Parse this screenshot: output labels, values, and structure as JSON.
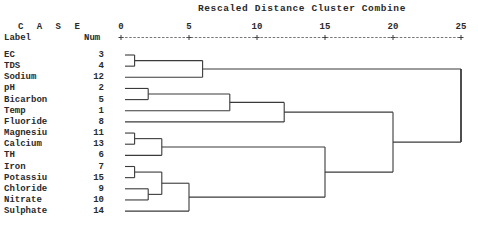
{
  "chart_data": {
    "type": "dendrogram",
    "title": "Rescaled Distance Cluster Combine",
    "column_headers": {
      "case": "C A S E",
      "label": "Label",
      "num": "Num"
    },
    "axis": {
      "ticks": [
        0,
        5,
        10,
        15,
        20,
        25
      ],
      "range": [
        0,
        25
      ]
    },
    "leaves": [
      {
        "label": "EC",
        "num": 3
      },
      {
        "label": "TDS",
        "num": 4
      },
      {
        "label": "Sodium",
        "num": 12
      },
      {
        "label": "pH",
        "num": 2
      },
      {
        "label": "Bicarbon",
        "num": 5
      },
      {
        "label": "Temp",
        "num": 1
      },
      {
        "label": "Fluoride",
        "num": 8
      },
      {
        "label": "Magnesiu",
        "num": 11
      },
      {
        "label": "Calcium",
        "num": 13
      },
      {
        "label": "TH",
        "num": 6
      },
      {
        "label": "Iron",
        "num": 7
      },
      {
        "label": "Potassiu",
        "num": 15
      },
      {
        "label": "Chloride",
        "num": 9
      },
      {
        "label": "Nitrate",
        "num": 10
      },
      {
        "label": "Sulphate",
        "num": 14
      }
    ],
    "merges": [
      {
        "id": "c1",
        "left": "EC",
        "right": "TDS",
        "distance": 1
      },
      {
        "id": "c2",
        "left": "c1",
        "right": "Sodium",
        "distance": 6
      },
      {
        "id": "c3",
        "left": "pH",
        "right": "Bicarbon",
        "distance": 2
      },
      {
        "id": "c4",
        "left": "c3",
        "right": "Temp",
        "distance": 8
      },
      {
        "id": "c5",
        "left": "c4",
        "right": "Fluoride",
        "distance": 12
      },
      {
        "id": "c6",
        "left": "Magnesiu",
        "right": "Calcium",
        "distance": 1
      },
      {
        "id": "c7",
        "left": "c6",
        "right": "TH",
        "distance": 3
      },
      {
        "id": "c8",
        "left": "Iron",
        "right": "Potassiu",
        "distance": 1
      },
      {
        "id": "c9",
        "left": "Chloride",
        "right": "Nitrate",
        "distance": 2
      },
      {
        "id": "c10",
        "left": "c8",
        "right": "c9",
        "distance": 3
      },
      {
        "id": "c11",
        "left": "c10",
        "right": "Sulphate",
        "distance": 5
      },
      {
        "id": "c12",
        "left": "c7",
        "right": "c11",
        "distance": 15
      },
      {
        "id": "c13",
        "left": "c5",
        "right": "c12",
        "distance": 20
      },
      {
        "id": "c14",
        "left": "c2",
        "right": "c13",
        "distance": 25
      }
    ]
  }
}
